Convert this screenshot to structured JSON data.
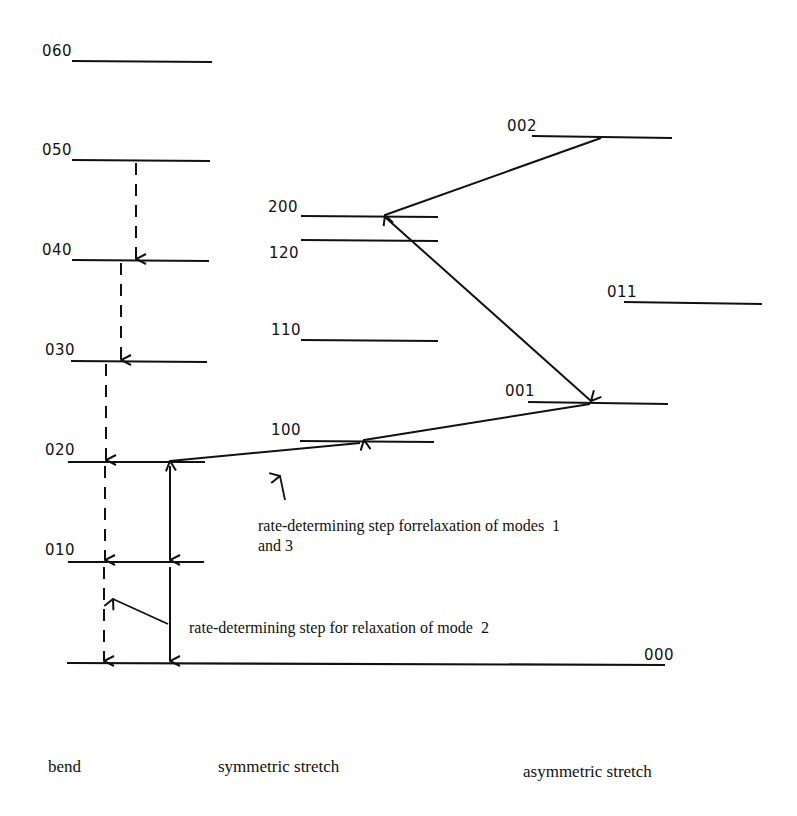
{
  "diagram": {
    "title": "",
    "levels": [
      {
        "id": "060",
        "label": "060",
        "mode": "bend"
      },
      {
        "id": "050",
        "label": "050",
        "mode": "bend"
      },
      {
        "id": "040",
        "label": "040",
        "mode": "bend"
      },
      {
        "id": "030",
        "label": "030",
        "mode": "bend"
      },
      {
        "id": "020",
        "label": "020",
        "mode": "bend"
      },
      {
        "id": "010",
        "label": "010",
        "mode": "bend"
      },
      {
        "id": "000",
        "label": "000",
        "mode": "ground"
      },
      {
        "id": "200",
        "label": "200",
        "mode": "symmetric stretch"
      },
      {
        "id": "120",
        "label": "120",
        "mode": "symmetric stretch"
      },
      {
        "id": "110",
        "label": "110",
        "mode": "symmetric stretch"
      },
      {
        "id": "100",
        "label": "100",
        "mode": "symmetric stretch"
      },
      {
        "id": "002",
        "label": "002",
        "mode": "asymmetric stretch"
      },
      {
        "id": "011",
        "label": "011",
        "mode": "asymmetric stretch"
      },
      {
        "id": "001",
        "label": "001",
        "mode": "asymmetric stretch"
      }
    ],
    "transitions": [
      {
        "from": "002",
        "to": "200",
        "style": "solid"
      },
      {
        "from": "200",
        "to": "001",
        "style": "solid"
      },
      {
        "from": "001",
        "to": "100",
        "style": "solid"
      },
      {
        "from": "100",
        "to": "020",
        "style": "solid"
      },
      {
        "from": "020",
        "to": "010",
        "style": "solid"
      },
      {
        "from": "010",
        "to": "000",
        "style": "solid"
      },
      {
        "from": "050",
        "to": "040",
        "style": "dashed"
      },
      {
        "from": "040",
        "to": "030",
        "style": "dashed"
      },
      {
        "from": "030",
        "to": "020",
        "style": "dashed"
      },
      {
        "from": "020",
        "to": "010",
        "style": "dashed"
      },
      {
        "from": "010",
        "to": "000",
        "style": "dashed"
      }
    ],
    "annotations": {
      "modes_1_3_line1": "rate-determining step forrelaxation of modes  1",
      "modes_1_3_line2": "and 3",
      "mode_2": "rate-determining step for relaxation of mode  2"
    },
    "column_labels": {
      "bend": "bend",
      "symmetric": "symmetric stretch",
      "asymmetric": "asymmetric stretch"
    }
  }
}
